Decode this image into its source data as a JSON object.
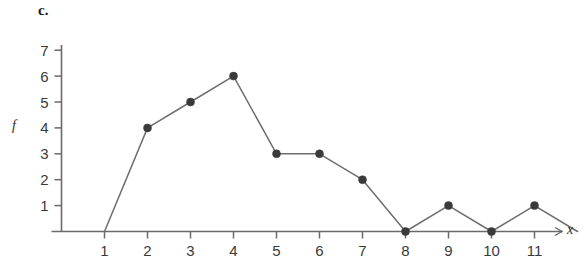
{
  "figure": {
    "part_label": "c.",
    "background_color": "#ffffff",
    "line_color": "#6e6e6e",
    "marker_color": "#3a3a3a",
    "axis_color": "#6a6a6a",
    "text_color": "#3a3a3a"
  },
  "chart_data": {
    "type": "line",
    "title": "c.",
    "xlabel": "x",
    "ylabel": "f",
    "x": [
      1,
      2,
      3,
      4,
      5,
      6,
      7,
      8,
      9,
      10,
      11,
      12
    ],
    "values": [
      0,
      4,
      5,
      6,
      3,
      3,
      2,
      0,
      1,
      0,
      1,
      0
    ],
    "markers_shown_at_x": [
      2,
      3,
      4,
      5,
      6,
      7,
      8,
      9,
      10,
      11
    ],
    "xlim": [
      0,
      12.8
    ],
    "ylim": [
      0,
      7.6
    ],
    "xticks": [
      1,
      2,
      3,
      4,
      5,
      6,
      7,
      8,
      9,
      10,
      11
    ],
    "xtick_labels": [
      "1",
      "2",
      "3",
      "4",
      "5",
      "6",
      "7",
      "8",
      "9",
      "10",
      "11"
    ],
    "yticks": [
      1,
      2,
      3,
      4,
      5,
      6,
      7
    ],
    "ytick_labels": [
      "1",
      "2",
      "3",
      "4",
      "5",
      "6",
      "7"
    ],
    "grid": false,
    "legend": null,
    "x_axis_arrow": true,
    "series_name": "f"
  }
}
